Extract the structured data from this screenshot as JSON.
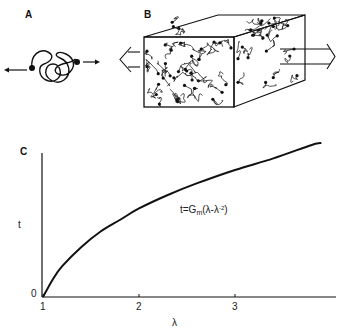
{
  "panels": {
    "a": {
      "label": "A",
      "description": "single polymer chain coil with crosslink ends pulled apart by arrows"
    },
    "b": {
      "label": "B",
      "description": "3D block of crosslinked polymer network stretched by arrows on both sides"
    },
    "c": {
      "label": "C"
    }
  },
  "icons": {
    "arrow_left": "arrow-left-icon",
    "arrow_right": "arrow-right-icon",
    "open_arrow_left": "open-arrow-left-icon",
    "open_arrow_right": "open-arrow-right-icon"
  },
  "equation": {
    "lhs": "t=G",
    "sub": "m",
    "mid": "(λ-λ",
    "sup": "-2",
    "end": ")"
  },
  "chart_data": {
    "type": "line",
    "title": "",
    "xlabel": "λ",
    "ylabel": "t",
    "x_ticks": [
      1,
      2,
      3
    ],
    "x_tick_labels": [
      "1",
      "2",
      "3"
    ],
    "y_tick_labels": [
      "0"
    ],
    "xlim": [
      1,
      3.95
    ],
    "ylim": [
      0,
      4.2
    ],
    "grid": false,
    "annotation": "t=Gm(λ-λ^-2)",
    "series": [
      {
        "name": "stress-strain",
        "x": [
          1.0,
          1.1,
          1.2,
          1.4,
          1.6,
          1.8,
          2.0,
          2.3,
          2.6,
          3.0,
          3.4,
          3.8,
          3.9
        ],
        "y": [
          0.0,
          0.45,
          0.8,
          1.3,
          1.7,
          2.0,
          2.3,
          2.65,
          2.95,
          3.3,
          3.6,
          3.95,
          4.0
        ]
      }
    ]
  }
}
